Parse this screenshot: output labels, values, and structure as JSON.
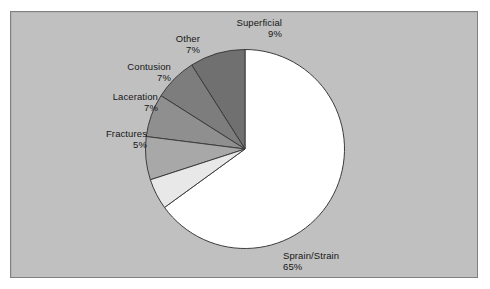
{
  "chart_data": {
    "type": "pie",
    "title": "",
    "subtitle": "",
    "xlabel": "",
    "ylabel": "",
    "legend_position": "none",
    "grid": false,
    "labels_show_percent": true,
    "start_angle_deg": 90,
    "direction": "counterclockwise",
    "categories": [
      "Superficial",
      "Other",
      "Contusion",
      "Laceration",
      "Fractures",
      "Sprain/Strain"
    ],
    "values": [
      9,
      7,
      7,
      7,
      5,
      65
    ],
    "value_labels": [
      "9%",
      "7%",
      "7%",
      "7%",
      "5%",
      "65%"
    ],
    "colors": [
      "#707070",
      "#7d7d7d",
      "#8f8f8f",
      "#a8a8a8",
      "#e8e8e8",
      "#ffffff"
    ],
    "slices": [
      {
        "name": "Superficial",
        "value": 9,
        "percent_label": "9%",
        "color": "#707070"
      },
      {
        "name": "Other",
        "value": 7,
        "percent_label": "7%",
        "color": "#7d7d7d"
      },
      {
        "name": "Contusion",
        "value": 7,
        "percent_label": "7%",
        "color": "#8f8f8f"
      },
      {
        "name": "Laceration",
        "value": 7,
        "percent_label": "7%",
        "color": "#a8a8a8"
      },
      {
        "name": "Fractures",
        "value": 5,
        "percent_label": "5%",
        "color": "#e8e8e8"
      },
      {
        "name": "Sprain/Strain",
        "value": 65,
        "percent_label": "65%",
        "color": "#ffffff"
      }
    ]
  },
  "figure": {
    "plot_background_color": "#c0c0c0",
    "plot_border_color": "#808080",
    "page_background_color": "#ffffff",
    "slice_outline_color": "#3c3c3c",
    "label_text_color": "#161616"
  },
  "labels": {
    "superficial": {
      "name": "Superficial",
      "value": "9%"
    },
    "other": {
      "name": "Other",
      "value": "7%"
    },
    "contusion": {
      "name": "Contusion",
      "value": "7%"
    },
    "laceration": {
      "name": "Laceration",
      "value": "7%"
    },
    "fractures": {
      "name": "Fractures",
      "value": "5%"
    },
    "sprain": {
      "name": "Sprain/Strain",
      "value": "65%"
    }
  }
}
